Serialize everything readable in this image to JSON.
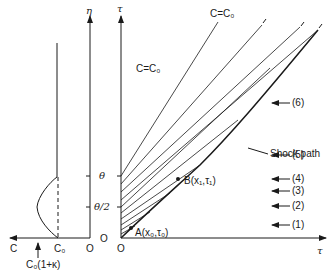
{
  "figure": {
    "left_panel": {
      "vertical_axis_label": "η",
      "horizontal_axis_label": "C",
      "origin_label": "O",
      "c0_tick_label": "C₀",
      "max_label": "C₀(1+κ)",
      "eta_ticks": [
        "θ",
        "θ/2",
        "O"
      ]
    },
    "right_panel": {
      "vertical_axis_label": "τ",
      "horizontal_axis_label": "τ",
      "origin_label": "O",
      "region_label": "C=C₀",
      "line_label": "C=C₀",
      "point_a": "A(x₀,τ₀)",
      "point_b": "B(x₁,τ₁)",
      "shock_label": "Shock path",
      "arrows": [
        "(6)",
        "(5)",
        "(4)",
        "(3)",
        "(2)",
        "(1)"
      ]
    }
  }
}
